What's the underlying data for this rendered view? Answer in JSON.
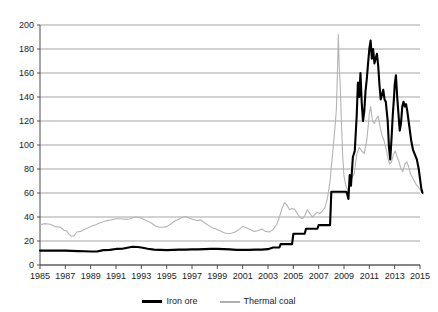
{
  "chart_data": {
    "type": "line",
    "title": "",
    "subtitle": "",
    "xlabel": "",
    "ylabel": "",
    "xlim": [
      1985,
      2015
    ],
    "ylim": [
      0,
      200
    ],
    "grid": true,
    "legend_position": "bottom-center",
    "y_ticks": [
      0,
      20,
      40,
      60,
      80,
      100,
      120,
      140,
      160,
      180,
      200
    ],
    "y_tick_labels": [
      "0",
      "20",
      "40",
      "60",
      "80",
      "100",
      "120",
      "140",
      "160",
      "180",
      "200"
    ],
    "x_ticks": [
      1985,
      1987,
      1989,
      1991,
      1993,
      1995,
      1997,
      1999,
      2001,
      2003,
      2005,
      2007,
      2009,
      2011,
      2013,
      2015
    ],
    "x_tick_labels": [
      "1985",
      "1987",
      "1989",
      "1991",
      "1993",
      "1995",
      "1997",
      "1999",
      "2001",
      "2003",
      "2005",
      "2007",
      "2009",
      "2011",
      "2013",
      "2015"
    ],
    "series": [
      {
        "name": "Iron ore",
        "color": "#000000",
        "line_width": 2.1,
        "points": [
          [
            1985.0,
            12.0
          ],
          [
            1985.5,
            12.0
          ],
          [
            1986.0,
            12.0
          ],
          [
            1986.5,
            12.0
          ],
          [
            1987.0,
            12.0
          ],
          [
            1987.5,
            11.8
          ],
          [
            1988.0,
            11.6
          ],
          [
            1988.5,
            11.4
          ],
          [
            1989.0,
            11.2
          ],
          [
            1989.5,
            11.2
          ],
          [
            1990.0,
            12.4
          ],
          [
            1990.5,
            12.6
          ],
          [
            1991.0,
            13.4
          ],
          [
            1991.5,
            13.6
          ],
          [
            1992.0,
            14.6
          ],
          [
            1992.3,
            15.2
          ],
          [
            1992.7,
            15.0
          ],
          [
            1993.0,
            14.6
          ],
          [
            1993.5,
            13.6
          ],
          [
            1994.0,
            12.8
          ],
          [
            1994.5,
            12.6
          ],
          [
            1995.0,
            12.4
          ],
          [
            1995.5,
            12.6
          ],
          [
            1996.0,
            12.8
          ],
          [
            1996.5,
            12.8
          ],
          [
            1997.0,
            13.0
          ],
          [
            1997.5,
            13.0
          ],
          [
            1998.0,
            13.2
          ],
          [
            1998.5,
            13.4
          ],
          [
            1999.0,
            13.4
          ],
          [
            1999.5,
            13.2
          ],
          [
            2000.0,
            13.0
          ],
          [
            2000.5,
            12.6
          ],
          [
            2001.0,
            12.6
          ],
          [
            2001.5,
            12.6
          ],
          [
            2002.0,
            12.8
          ],
          [
            2002.5,
            12.8
          ],
          [
            2003.0,
            13.2
          ],
          [
            2003.4,
            14.6
          ],
          [
            2003.9,
            14.6
          ],
          [
            2004.0,
            17.4
          ],
          [
            2004.9,
            17.4
          ],
          [
            2005.0,
            26.0
          ],
          [
            2005.9,
            26.0
          ],
          [
            2006.0,
            30.2
          ],
          [
            2006.9,
            30.2
          ],
          [
            2007.0,
            33.2
          ],
          [
            2007.9,
            33.2
          ],
          [
            2008.0,
            61.0
          ],
          [
            2008.9,
            61.0
          ],
          [
            2009.0,
            61.0
          ],
          [
            2009.2,
            61.0
          ],
          [
            2009.35,
            55.0
          ],
          [
            2009.45,
            75.0
          ],
          [
            2009.55,
            66.0
          ],
          [
            2009.7,
            90.0
          ],
          [
            2009.85,
            95.0
          ],
          [
            2010.0,
            124.0
          ],
          [
            2010.1,
            152.0
          ],
          [
            2010.2,
            140.0
          ],
          [
            2010.3,
            160.0
          ],
          [
            2010.4,
            135.0
          ],
          [
            2010.5,
            120.0
          ],
          [
            2010.6,
            128.0
          ],
          [
            2010.7,
            145.0
          ],
          [
            2010.8,
            155.0
          ],
          [
            2010.9,
            168.0
          ],
          [
            2011.0,
            180.0
          ],
          [
            2011.1,
            187.0
          ],
          [
            2011.2,
            172.0
          ],
          [
            2011.3,
            180.0
          ],
          [
            2011.4,
            168.0
          ],
          [
            2011.5,
            172.0
          ],
          [
            2011.6,
            176.0
          ],
          [
            2011.7,
            166.0
          ],
          [
            2011.8,
            150.0
          ],
          [
            2011.9,
            138.0
          ],
          [
            2012.0,
            142.0
          ],
          [
            2012.1,
            146.0
          ],
          [
            2012.2,
            138.0
          ],
          [
            2012.3,
            136.0
          ],
          [
            2012.45,
            120.0
          ],
          [
            2012.55,
            98.0
          ],
          [
            2012.65,
            88.0
          ],
          [
            2012.75,
            105.0
          ],
          [
            2012.85,
            125.0
          ],
          [
            2012.95,
            140.0
          ],
          [
            2013.0,
            150.0
          ],
          [
            2013.1,
            158.0
          ],
          [
            2013.2,
            140.0
          ],
          [
            2013.3,
            126.0
          ],
          [
            2013.4,
            112.0
          ],
          [
            2013.5,
            118.0
          ],
          [
            2013.6,
            132.0
          ],
          [
            2013.7,
            136.0
          ],
          [
            2013.8,
            132.0
          ],
          [
            2013.9,
            134.0
          ],
          [
            2014.0,
            128.0
          ],
          [
            2014.1,
            120.0
          ],
          [
            2014.2,
            112.0
          ],
          [
            2014.3,
            104.0
          ],
          [
            2014.45,
            96.0
          ],
          [
            2014.6,
            92.0
          ],
          [
            2014.75,
            88.0
          ],
          [
            2014.9,
            80.0
          ],
          [
            2015.0,
            72.0
          ],
          [
            2015.1,
            64.0
          ],
          [
            2015.2,
            60.0
          ]
        ]
      },
      {
        "name": "Thermal coal",
        "color": "#b4b4b4",
        "line_width": 1.1,
        "points": [
          [
            1985.0,
            33.5
          ],
          [
            1985.4,
            34.5
          ],
          [
            1985.8,
            34.0
          ],
          [
            1986.2,
            32.0
          ],
          [
            1986.6,
            31.5
          ],
          [
            1986.9,
            29.0
          ],
          [
            1987.1,
            28.5
          ],
          [
            1987.3,
            25.5
          ],
          [
            1987.5,
            24.0
          ],
          [
            1987.7,
            24.5
          ],
          [
            1987.9,
            27.5
          ],
          [
            1988.2,
            28.0
          ],
          [
            1988.5,
            29.5
          ],
          [
            1988.8,
            31.0
          ],
          [
            1989.1,
            32.5
          ],
          [
            1989.4,
            33.5
          ],
          [
            1989.7,
            35.0
          ],
          [
            1990.0,
            36.0
          ],
          [
            1990.3,
            37.0
          ],
          [
            1990.6,
            37.5
          ],
          [
            1991.0,
            38.5
          ],
          [
            1991.4,
            38.5
          ],
          [
            1991.8,
            38.0
          ],
          [
            1992.1,
            38.5
          ],
          [
            1992.5,
            40.0
          ],
          [
            1992.9,
            39.5
          ],
          [
            1993.2,
            38.0
          ],
          [
            1993.5,
            36.5
          ],
          [
            1993.8,
            35.0
          ],
          [
            1994.1,
            32.5
          ],
          [
            1994.4,
            31.5
          ],
          [
            1994.7,
            31.5
          ],
          [
            1995.0,
            32.0
          ],
          [
            1995.3,
            34.0
          ],
          [
            1995.6,
            36.5
          ],
          [
            1995.9,
            38.0
          ],
          [
            1996.2,
            39.5
          ],
          [
            1996.5,
            40.5
          ],
          [
            1996.8,
            39.0
          ],
          [
            1997.1,
            38.0
          ],
          [
            1997.4,
            37.0
          ],
          [
            1997.7,
            37.5
          ],
          [
            1998.0,
            35.0
          ],
          [
            1998.3,
            33.0
          ],
          [
            1998.6,
            31.0
          ],
          [
            1998.9,
            30.0
          ],
          [
            1999.2,
            28.5
          ],
          [
            1999.5,
            27.0
          ],
          [
            1999.8,
            26.0
          ],
          [
            2000.1,
            26.5
          ],
          [
            2000.4,
            27.5
          ],
          [
            2000.7,
            29.5
          ],
          [
            2001.0,
            32.0
          ],
          [
            2001.3,
            31.0
          ],
          [
            2001.6,
            29.5
          ],
          [
            2001.9,
            28.0
          ],
          [
            2002.2,
            28.5
          ],
          [
            2002.5,
            30.0
          ],
          [
            2002.8,
            28.0
          ],
          [
            2003.1,
            27.5
          ],
          [
            2003.4,
            29.5
          ],
          [
            2003.7,
            34.0
          ],
          [
            2003.9,
            40.0
          ],
          [
            2004.1,
            47.0
          ],
          [
            2004.3,
            52.0
          ],
          [
            2004.5,
            50.0
          ],
          [
            2004.7,
            46.0
          ],
          [
            2004.9,
            47.0
          ],
          [
            2005.1,
            46.5
          ],
          [
            2005.3,
            43.0
          ],
          [
            2005.5,
            40.0
          ],
          [
            2005.7,
            38.5
          ],
          [
            2005.9,
            41.0
          ],
          [
            2006.1,
            46.0
          ],
          [
            2006.3,
            43.0
          ],
          [
            2006.5,
            40.0
          ],
          [
            2006.7,
            42.0
          ],
          [
            2006.9,
            44.0
          ],
          [
            2007.1,
            43.0
          ],
          [
            2007.3,
            45.0
          ],
          [
            2007.5,
            48.0
          ],
          [
            2007.7,
            56.0
          ],
          [
            2007.9,
            70.0
          ],
          [
            2008.0,
            82.0
          ],
          [
            2008.15,
            98.0
          ],
          [
            2008.3,
            116.0
          ],
          [
            2008.4,
            130.0
          ],
          [
            2008.5,
            168.0
          ],
          [
            2008.55,
            192.0
          ],
          [
            2008.62,
            166.0
          ],
          [
            2008.7,
            150.0
          ],
          [
            2008.8,
            118.0
          ],
          [
            2008.9,
            90.0
          ],
          [
            2009.0,
            74.0
          ],
          [
            2009.15,
            66.0
          ],
          [
            2009.3,
            62.0
          ],
          [
            2009.45,
            68.0
          ],
          [
            2009.6,
            72.0
          ],
          [
            2009.8,
            76.0
          ],
          [
            2010.0,
            92.0
          ],
          [
            2010.2,
            98.0
          ],
          [
            2010.4,
            95.0
          ],
          [
            2010.6,
            93.0
          ],
          [
            2010.8,
            104.0
          ],
          [
            2011.0,
            126.0
          ],
          [
            2011.1,
            132.0
          ],
          [
            2011.25,
            120.0
          ],
          [
            2011.4,
            118.0
          ],
          [
            2011.55,
            122.0
          ],
          [
            2011.7,
            124.0
          ],
          [
            2011.85,
            115.0
          ],
          [
            2012.0,
            108.0
          ],
          [
            2012.15,
            104.0
          ],
          [
            2012.3,
            98.0
          ],
          [
            2012.45,
            90.0
          ],
          [
            2012.6,
            84.0
          ],
          [
            2012.75,
            86.0
          ],
          [
            2012.9,
            92.0
          ],
          [
            2013.05,
            95.0
          ],
          [
            2013.2,
            90.0
          ],
          [
            2013.35,
            86.0
          ],
          [
            2013.5,
            80.0
          ],
          [
            2013.65,
            78.0
          ],
          [
            2013.8,
            84.0
          ],
          [
            2013.95,
            86.0
          ],
          [
            2014.1,
            82.0
          ],
          [
            2014.25,
            76.0
          ],
          [
            2014.4,
            73.0
          ],
          [
            2014.55,
            70.0
          ],
          [
            2014.7,
            67.0
          ],
          [
            2014.85,
            65.0
          ],
          [
            2015.0,
            63.0
          ],
          [
            2015.1,
            61.0
          ],
          [
            2015.2,
            60.0
          ]
        ]
      }
    ]
  },
  "legend": {
    "entries": [
      {
        "label": "Iron ore"
      },
      {
        "label": "Thermal coal"
      }
    ]
  },
  "colors": {
    "iron_ore": "#000000",
    "thermal_coal": "#b4b4b4",
    "gridline": "#808080",
    "axis": "#4d4d4d",
    "background": "#ffffff"
  }
}
